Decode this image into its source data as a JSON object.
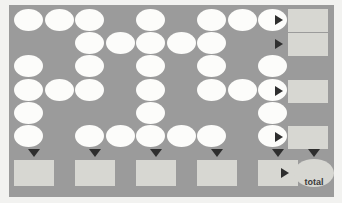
{
  "diagram": {
    "title": "",
    "total_label": "total",
    "colors": {
      "background": "#f2f2f0",
      "panel": "#9b9b9b",
      "cell": "#fcfcfa",
      "box": "#d7d7d2",
      "arrow": "#2e2e2e"
    },
    "grid": {
      "columns": 9,
      "rows": 6,
      "cell_width": 29,
      "cell_height": 22,
      "col_step": 30.5,
      "row_step": 23.2,
      "origin_x": 14,
      "origin_y": 9,
      "filled_cells": [
        [
          1,
          1,
          1,
          0,
          1,
          0,
          1,
          1,
          1
        ],
        [
          0,
          0,
          1,
          1,
          1,
          1,
          1,
          0,
          0
        ],
        [
          1,
          0,
          1,
          0,
          1,
          0,
          1,
          0,
          1
        ],
        [
          1,
          1,
          1,
          0,
          1,
          0,
          1,
          1,
          1
        ],
        [
          1,
          0,
          0,
          0,
          1,
          0,
          0,
          0,
          1
        ],
        [
          1,
          0,
          1,
          1,
          1,
          1,
          1,
          0,
          1
        ]
      ]
    },
    "row_summaries": [
      {
        "row": 1,
        "x": 288,
        "y": 9,
        "w": 40,
        "h": 23,
        "arrow_x": 275,
        "arrow_y": 15
      },
      {
        "row": 2,
        "x": 288,
        "y": 33,
        "w": 40,
        "h": 23,
        "arrow_x": 275,
        "arrow_y": 39
      },
      {
        "row": 4,
        "x": 288,
        "y": 80,
        "w": 40,
        "h": 23,
        "arrow_x": 275,
        "arrow_y": 86
      },
      {
        "row": 6,
        "x": 288,
        "y": 126,
        "w": 40,
        "h": 23,
        "arrow_x": 275,
        "arrow_y": 132
      }
    ],
    "column_summaries": [
      {
        "col": 1,
        "x": 14,
        "y": 160,
        "w": 40,
        "h": 26,
        "arrow_x": 28,
        "arrow_y": 149
      },
      {
        "col": 3,
        "x": 75,
        "y": 160,
        "w": 40,
        "h": 26,
        "arrow_x": 89,
        "arrow_y": 149
      },
      {
        "col": 5,
        "x": 136,
        "y": 160,
        "w": 40,
        "h": 26,
        "arrow_x": 150,
        "arrow_y": 149
      },
      {
        "col": 7,
        "x": 197,
        "y": 160,
        "w": 40,
        "h": 26,
        "arrow_x": 211,
        "arrow_y": 149
      },
      {
        "col": 9,
        "x": 258,
        "y": 160,
        "w": 40,
        "h": 26,
        "arrow_x": 272,
        "arrow_y": 149
      }
    ],
    "total": {
      "x": 294,
      "y": 159,
      "w": 40,
      "h": 28,
      "arrow_down_x": 308,
      "arrow_down_y": 149,
      "arrow_right_x": 281,
      "arrow_right_y": 168,
      "label_x": 294,
      "label_y": 177
    }
  }
}
